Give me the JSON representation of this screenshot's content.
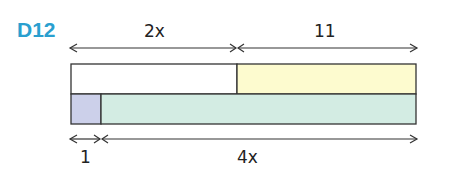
{
  "problem": {
    "id": "D12",
    "id_color": "#2a9fcf"
  },
  "diagram": {
    "type": "bar-model",
    "top_bar": {
      "segments": [
        {
          "label": "2x",
          "fill": "#ffffff"
        },
        {
          "label": "11",
          "fill": "#fdfbcf"
        }
      ]
    },
    "bottom_bar": {
      "segments": [
        {
          "label": "1",
          "fill": "#ccd0ea"
        },
        {
          "label": "4x",
          "fill": "#d3ece3"
        }
      ]
    },
    "labels": {
      "top_left": "2x",
      "top_right": "11",
      "bottom_left": "1",
      "bottom_right": "4x"
    },
    "stroke_color": "#333333"
  }
}
